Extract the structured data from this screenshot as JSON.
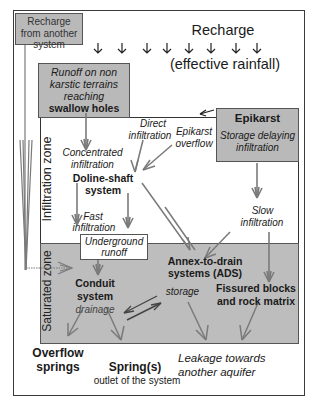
{
  "diagram": {
    "recharge_from_other": "Recharge from another system",
    "recharge": {
      "title": "Recharge",
      "subtitle": "(effective rainfall)",
      "arrow_count": 8
    },
    "runoff_box": {
      "line1": "Runoff on non",
      "line2": "karstic terrains",
      "line3": "reaching",
      "line4": "swallow holes"
    },
    "epikarst_box": {
      "title": "Epikarst",
      "line1": "Storage delaying",
      "line2": "infiltration"
    },
    "zones": {
      "infiltration": "Infiltration zone",
      "saturated": "Saturated zone"
    },
    "labels": {
      "direct_infiltration_1": "Direct",
      "direct_infiltration_2": "infiltration",
      "epikarst_overflow_1": "Epikarst",
      "epikarst_overflow_2": "overflow",
      "concentrated_1": "Concentrated",
      "concentrated_2": "infiltration",
      "doline_1": "Doline-shaft",
      "doline_2": "system",
      "fast_1": "Fast",
      "fast_2": "infiltration",
      "slow_1": "Slow",
      "slow_2": "infiltration",
      "underground_runoff_1": "Underground",
      "underground_runoff_2": "runoff",
      "ads_1": "Annex-to-drain",
      "ads_2": "systems (ADS)",
      "conduit_1": "Conduit",
      "conduit_2": "system",
      "storage": "storage",
      "drainage": "drainage",
      "fissured_1": "Fissured blocks",
      "fissured_2": "and rock matrix",
      "overflow_1": "Overflow",
      "overflow_2": "springs",
      "springs": "Spring(s)",
      "springs_sub": "outlet of the system",
      "leakage_1": "Leakage towards",
      "leakage_2": "another aquifer"
    },
    "colors": {
      "box_gray": "#b9b9b9",
      "saturated_zone": "#bdbdbd",
      "arrow": "#7a7a7a",
      "border": "#333333"
    }
  }
}
